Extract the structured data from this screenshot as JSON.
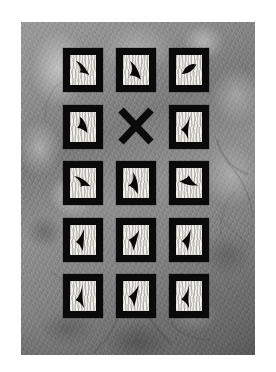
{
  "image": {
    "title": "Feather specimen grid photograph",
    "description": "Black-and-white photograph of a five-row by three-column grid of black-framed white cards, each mounted with a dark feather silhouette, on a mottled gray textured background. The center card of the second row is replaced by a large black X.",
    "canvas": {
      "width": 276,
      "height": 372,
      "background_color": "#ffffff"
    },
    "photo": {
      "left": 21,
      "top": 22,
      "width": 234,
      "height": 333,
      "background_color": "#8a8a8a",
      "texture": "mottled gray stone-like surface with light patches and dark branch streaks"
    },
    "colors": {
      "frame": "#0a0a0a",
      "mat": "#f2f0ec",
      "feather": "#090909",
      "background_light": "#9b9b9b",
      "background_dark": "#5f5f5f",
      "page": "#ffffff"
    }
  },
  "grid": {
    "rows": 5,
    "columns": 3,
    "cell_width": 40,
    "cell_height": 44,
    "column_gap": 13,
    "row_gap": 6.5,
    "marker_label": "X",
    "cells": [
      {
        "id": "r1c1",
        "row": 1,
        "col": 1,
        "type": "feather-card",
        "orientation_deg": 205,
        "shape": "feather-curved"
      },
      {
        "id": "r1c2",
        "row": 1,
        "col": 2,
        "type": "feather-card",
        "orientation_deg": 200,
        "shape": "feather-hooked"
      },
      {
        "id": "r1c3",
        "row": 1,
        "col": 3,
        "type": "feather-card",
        "orientation_deg": 255,
        "shape": "feather-narrow"
      },
      {
        "id": "r2c1",
        "row": 2,
        "col": 1,
        "type": "feather-card",
        "orientation_deg": 230,
        "shape": "feather-broad"
      },
      {
        "id": "r2c2",
        "row": 2,
        "col": 2,
        "type": "x-marker",
        "orientation_deg": 0,
        "shape": "cross"
      },
      {
        "id": "r2c3",
        "row": 2,
        "col": 3,
        "type": "feather-card",
        "orientation_deg": 145,
        "shape": "feather-plume"
      },
      {
        "id": "r3c1",
        "row": 3,
        "col": 1,
        "type": "feather-card",
        "orientation_deg": 190,
        "shape": "feather-curved"
      },
      {
        "id": "r3c2",
        "row": 3,
        "col": 2,
        "type": "feather-card",
        "orientation_deg": 220,
        "shape": "feather-hooked"
      },
      {
        "id": "r3c3",
        "row": 3,
        "col": 3,
        "type": "feather-card",
        "orientation_deg": 250,
        "shape": "feather-tapered"
      },
      {
        "id": "r4c1",
        "row": 4,
        "col": 1,
        "type": "feather-card",
        "orientation_deg": 145,
        "shape": "feather-slender"
      },
      {
        "id": "r4c2",
        "row": 4,
        "col": 2,
        "type": "feather-card",
        "orientation_deg": 160,
        "shape": "feather-slender"
      },
      {
        "id": "r4c3",
        "row": 4,
        "col": 3,
        "type": "feather-card",
        "orientation_deg": 150,
        "shape": "feather-slender"
      },
      {
        "id": "r5c1",
        "row": 5,
        "col": 1,
        "type": "feather-card",
        "orientation_deg": 135,
        "shape": "feather-plume"
      },
      {
        "id": "r5c2",
        "row": 5,
        "col": 2,
        "type": "feather-card",
        "orientation_deg": 155,
        "shape": "feather-slender"
      },
      {
        "id": "r5c3",
        "row": 5,
        "col": 3,
        "type": "feather-card",
        "orientation_deg": 140,
        "shape": "feather-plume"
      }
    ]
  },
  "background_streaks": [
    {
      "x1": 196,
      "y1": 118,
      "x2": 226,
      "y2": 152,
      "width": 2.0,
      "opacity": 0.35
    },
    {
      "x1": 206,
      "y1": 140,
      "x2": 232,
      "y2": 196,
      "width": 1.6,
      "opacity": 0.3
    },
    {
      "x1": 214,
      "y1": 170,
      "x2": 200,
      "y2": 214,
      "width": 1.4,
      "opacity": 0.28
    },
    {
      "x1": 198,
      "y1": 196,
      "x2": 230,
      "y2": 226,
      "width": 1.5,
      "opacity": 0.26
    },
    {
      "x1": 120,
      "y1": 282,
      "x2": 150,
      "y2": 322,
      "width": 2.2,
      "opacity": 0.34
    },
    {
      "x1": 96,
      "y1": 296,
      "x2": 74,
      "y2": 330,
      "width": 1.8,
      "opacity": 0.3
    },
    {
      "x1": 150,
      "y1": 300,
      "x2": 188,
      "y2": 318,
      "width": 1.5,
      "opacity": 0.24
    },
    {
      "x1": 30,
      "y1": 250,
      "x2": 54,
      "y2": 286,
      "width": 1.6,
      "opacity": 0.26
    },
    {
      "x1": 40,
      "y1": 60,
      "x2": 24,
      "y2": 100,
      "width": 1.4,
      "opacity": 0.22
    }
  ]
}
